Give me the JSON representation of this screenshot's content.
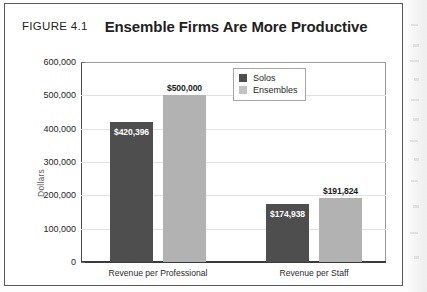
{
  "figure": {
    "number": "FIGURE 4.1",
    "title": "Ensemble Firms Are More Productive"
  },
  "chart_data": {
    "type": "bar",
    "title": "Ensemble Firms Are More Productive",
    "xlabel": "",
    "ylabel": "Dollars",
    "ylim": [
      0,
      600000
    ],
    "ytick_labels": [
      "600,000",
      "500,000",
      "400,000",
      "300,000",
      "200,000",
      "100,000",
      "0"
    ],
    "ytick_values": [
      600000,
      500000,
      400000,
      300000,
      200000,
      100000,
      0
    ],
    "grid": true,
    "legend_position": "upper right",
    "categories": [
      "Revenue per Professional",
      "Revenue per Staff"
    ],
    "series": [
      {
        "name": "Solos",
        "color": "#4e4e4e",
        "values": [
          420396,
          174938
        ],
        "labels": [
          "$420,396",
          "$174,938"
        ],
        "label_placement": [
          "inside",
          "inside"
        ]
      },
      {
        "name": "Ensembles",
        "color": "#b2b2b2",
        "values": [
          500000,
          191824
        ],
        "labels": [
          "$500,000",
          "$191,824"
        ],
        "label_placement": [
          "above",
          "above"
        ]
      }
    ]
  }
}
